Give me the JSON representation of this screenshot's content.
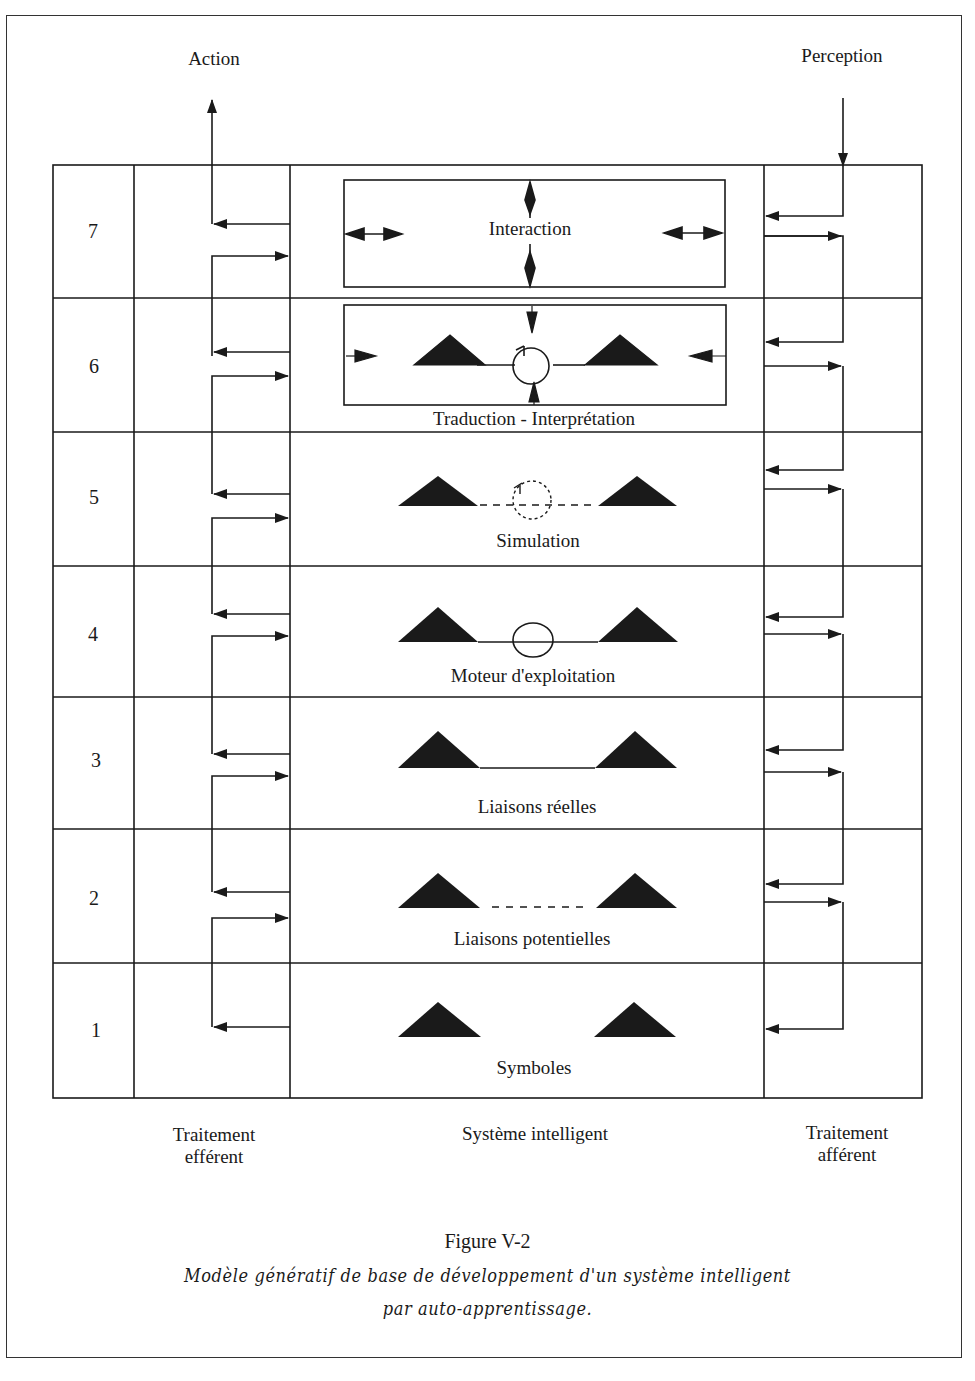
{
  "page": {
    "top_cut_text": "... figure ... y ..."
  },
  "io": {
    "action_label": "Action",
    "perception_label": "Perception"
  },
  "levels": [
    {
      "number": "7",
      "label": "Interaction",
      "symbol": "interaction-box"
    },
    {
      "number": "6",
      "label": "Traduction - Interprétation",
      "symbol": "triangles-solid-link-loop-boxed"
    },
    {
      "number": "5",
      "label": "Simulation",
      "symbol": "triangles-dashed-link-dashed-loop"
    },
    {
      "number": "4",
      "label": "Moteur d'exploitation",
      "symbol": "triangles-solid-link-ellipse"
    },
    {
      "number": "3",
      "label": "Liaisons réelles",
      "symbol": "triangles-solid-link"
    },
    {
      "number": "2",
      "label": "Liaisons potentielles",
      "symbol": "triangles-dashed-link"
    },
    {
      "number": "1",
      "label": "Symboles",
      "symbol": "triangles-unlinked"
    }
  ],
  "columns": {
    "left_line1": "Traitement",
    "left_line2": "efférent",
    "center": "Système intelligent",
    "right_line1": "Traitement",
    "right_line2": "afférent"
  },
  "caption": {
    "title": "Figure V-2",
    "line1": "Modèle génératif de base de développement d'un système intelligent",
    "line2": "par auto-apprentissage."
  },
  "colors": {
    "ink": "#1a1a1a",
    "background": "#ffffff"
  }
}
